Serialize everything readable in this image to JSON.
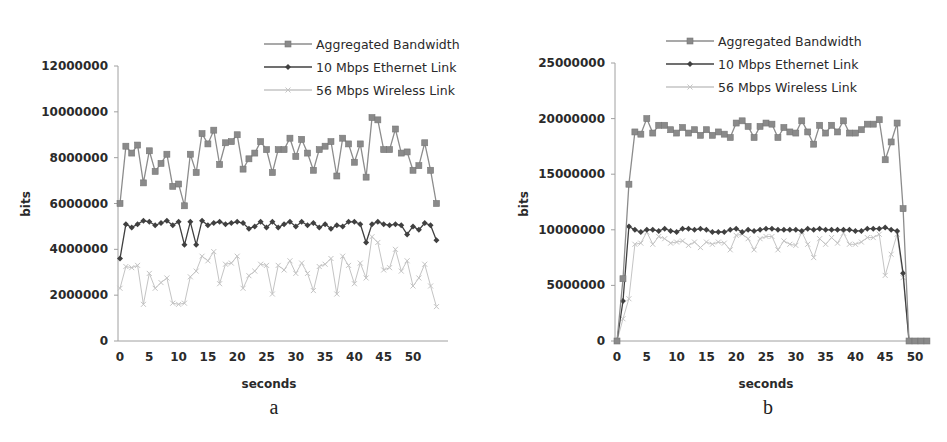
{
  "chart_data": [
    {
      "id": "a",
      "type": "line",
      "caption": "a",
      "title": "",
      "xlabel": "seconds",
      "ylabel": "bits",
      "xlim": [
        0,
        54
      ],
      "ylim": [
        0,
        12000000
      ],
      "x_ticks": [
        "0",
        "5",
        "10",
        "15",
        "20",
        "25",
        "30",
        "35",
        "40",
        "45",
        "50"
      ],
      "x_tick_values": [
        0,
        5,
        10,
        15,
        20,
        25,
        30,
        35,
        40,
        45,
        50
      ],
      "y_ticks": [
        "0",
        "2000000",
        "4000000",
        "6000000",
        "8000000",
        "10000000",
        "12000000"
      ],
      "y_tick_values": [
        0,
        2000000,
        4000000,
        6000000,
        8000000,
        10000000,
        12000000
      ],
      "grid": false,
      "legend_position": "top-right",
      "x": [
        0,
        1,
        2,
        3,
        4,
        5,
        6,
        7,
        8,
        9,
        10,
        11,
        12,
        13,
        14,
        15,
        16,
        17,
        18,
        19,
        20,
        21,
        22,
        23,
        24,
        25,
        26,
        27,
        28,
        29,
        30,
        31,
        32,
        33,
        34,
        35,
        36,
        37,
        38,
        39,
        40,
        41,
        42,
        43,
        44,
        45,
        46,
        47,
        48,
        49,
        50,
        51,
        52,
        53,
        54
      ],
      "series": [
        {
          "name": "Aggregated Bandwidth",
          "color": "#8c8c8c",
          "marker": "square",
          "values": [
            6000000,
            8500000,
            8200000,
            8550000,
            6900000,
            8300000,
            7400000,
            7750000,
            8150000,
            6750000,
            6850000,
            5900000,
            8150000,
            7350000,
            9050000,
            8600000,
            9200000,
            7700000,
            8650000,
            8700000,
            9000000,
            7500000,
            7950000,
            8200000,
            8700000,
            8350000,
            7350000,
            8350000,
            8350000,
            8850000,
            8050000,
            8800000,
            8200000,
            7450000,
            8350000,
            8500000,
            8700000,
            7200000,
            8850000,
            8600000,
            7800000,
            8600000,
            7150000,
            9750000,
            9650000,
            8350000,
            8350000,
            9250000,
            8200000,
            8250000,
            7450000,
            7650000,
            8650000,
            7450000,
            6000000
          ]
        },
        {
          "name": "10 Mbps Ethernet Link",
          "color": "#404040",
          "marker": "diamond",
          "values": [
            3600000,
            5100000,
            4950000,
            5100000,
            5250000,
            5200000,
            5050000,
            5150000,
            5250000,
            5050000,
            5200000,
            4200000,
            5200000,
            4200000,
            5250000,
            5050000,
            5150000,
            5200000,
            5100000,
            5150000,
            5200000,
            5150000,
            4900000,
            5000000,
            5200000,
            4950000,
            5200000,
            4950000,
            5100000,
            5200000,
            5000000,
            5200000,
            5050000,
            5150000,
            4950000,
            5100000,
            4900000,
            5050000,
            5000000,
            5200000,
            5200000,
            5100000,
            4300000,
            5100000,
            5200000,
            5100000,
            5050000,
            5100000,
            5050000,
            4650000,
            5000000,
            4850000,
            5150000,
            5050000,
            4400000
          ]
        },
        {
          "name": "56 Mbps Wireless Link",
          "color": "#c4c4c4",
          "marker": "x",
          "values": [
            2300000,
            3250000,
            3200000,
            3300000,
            1600000,
            2950000,
            2300000,
            2550000,
            2750000,
            1650000,
            1600000,
            1650000,
            2800000,
            3050000,
            3700000,
            3500000,
            3900000,
            2500000,
            3350000,
            3400000,
            3700000,
            2300000,
            2850000,
            3050000,
            3350000,
            3300000,
            2050000,
            3300000,
            3100000,
            3500000,
            2950000,
            3400000,
            2950000,
            2200000,
            3250000,
            3350000,
            3600000,
            2050000,
            3700000,
            3300000,
            2500000,
            3400000,
            2750000,
            4550000,
            4300000,
            3100000,
            3200000,
            4000000,
            3050000,
            3500000,
            2400000,
            2750000,
            3350000,
            2400000,
            1500000
          ]
        }
      ]
    },
    {
      "id": "b",
      "type": "line",
      "caption": "b",
      "title": "",
      "xlabel": "seconds",
      "ylabel": "bits",
      "xlim": [
        0,
        52
      ],
      "ylim": [
        0,
        25000000
      ],
      "x_ticks": [
        "0",
        "5",
        "10",
        "15",
        "20",
        "25",
        "30",
        "35",
        "40",
        "45",
        "50"
      ],
      "x_tick_values": [
        0,
        5,
        10,
        15,
        20,
        25,
        30,
        35,
        40,
        45,
        50
      ],
      "y_ticks": [
        "0",
        "5000000",
        "10000000",
        "15000000",
        "20000000",
        "25000000"
      ],
      "y_tick_values": [
        0,
        5000000,
        10000000,
        15000000,
        20000000,
        25000000
      ],
      "grid": false,
      "legend_position": "top-right",
      "x": [
        0,
        1,
        2,
        3,
        4,
        5,
        6,
        7,
        8,
        9,
        10,
        11,
        12,
        13,
        14,
        15,
        16,
        17,
        18,
        19,
        20,
        21,
        22,
        23,
        24,
        25,
        26,
        27,
        28,
        29,
        30,
        31,
        32,
        33,
        34,
        35,
        36,
        37,
        38,
        39,
        40,
        41,
        42,
        43,
        44,
        45,
        46,
        47,
        48,
        49,
        50,
        51,
        52
      ],
      "series": [
        {
          "name": "Aggregated Bandwidth",
          "color": "#8c8c8c",
          "marker": "square",
          "values": [
            0,
            5600000,
            14100000,
            18800000,
            18600000,
            20000000,
            18700000,
            19400000,
            19400000,
            19000000,
            18700000,
            19200000,
            18700000,
            19000000,
            18500000,
            19000000,
            18500000,
            18800000,
            18600000,
            18300000,
            19600000,
            19800000,
            19300000,
            18300000,
            19300000,
            19600000,
            19500000,
            18300000,
            19200000,
            18800000,
            18700000,
            19800000,
            18800000,
            17700000,
            19400000,
            18700000,
            19400000,
            18800000,
            19800000,
            18700000,
            18700000,
            19000000,
            19500000,
            19500000,
            19900000,
            16300000,
            17900000,
            19600000,
            11900000,
            0,
            0,
            0,
            0
          ]
        },
        {
          "name": "10 Mbps Ethernet Link",
          "color": "#404040",
          "marker": "diamond",
          "values": [
            0,
            3600000,
            10300000,
            10000000,
            9800000,
            10000000,
            10000000,
            9900000,
            10100000,
            9900000,
            9800000,
            10100000,
            10100000,
            10000000,
            10100000,
            10000000,
            9800000,
            9800000,
            9800000,
            10000000,
            10100000,
            9800000,
            10000000,
            9900000,
            10000000,
            10100000,
            10100000,
            10000000,
            10000000,
            10000000,
            10000000,
            9900000,
            10100000,
            10000000,
            10100000,
            10000000,
            10000000,
            10000000,
            10000000,
            10000000,
            9900000,
            9900000,
            10100000,
            10100000,
            10100000,
            10200000,
            10000000,
            9900000,
            6100000,
            0,
            0,
            0,
            0
          ]
        },
        {
          "name": "56 Mbps Wireless Link",
          "color": "#c4c4c4",
          "marker": "x",
          "values": [
            0,
            2000000,
            3800000,
            8700000,
            8800000,
            9800000,
            8700000,
            9400000,
            9200000,
            8800000,
            8900000,
            9000000,
            8600000,
            8900000,
            8400000,
            8900000,
            8700000,
            8900000,
            8800000,
            8200000,
            9500000,
            9600000,
            9200000,
            8200000,
            9200000,
            9400000,
            9400000,
            8200000,
            9000000,
            8700000,
            8600000,
            9800000,
            8700000,
            7500000,
            9200000,
            8700000,
            9300000,
            8800000,
            9700000,
            8700000,
            8700000,
            8900000,
            9300000,
            9300000,
            9600000,
            5900000,
            7800000,
            9600000,
            5700000,
            0,
            0,
            0,
            0
          ]
        }
      ]
    }
  ]
}
